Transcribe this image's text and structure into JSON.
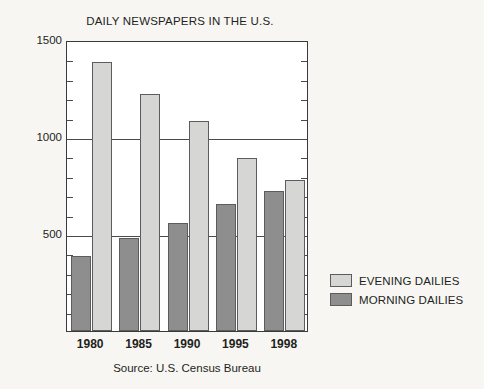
{
  "chart_data": {
    "type": "bar",
    "title": "DAILY NEWSPAPERS IN THE U.S.",
    "xlabel": "",
    "ylabel": "",
    "categories": [
      "1980",
      "1985",
      "1990",
      "1995",
      "1998"
    ],
    "series": [
      {
        "name": "EVENING DAILIES",
        "color": "#d6d6d4",
        "values": [
          1388,
          1220,
          1084,
          891,
          781
        ]
      },
      {
        "name": "MORNING DAILIES",
        "color": "#8e8e8e",
        "values": [
          387,
          482,
          559,
          656,
          721
        ]
      }
    ],
    "ylim": [
      0,
      1500
    ],
    "ytick_labels": [
      "1500",
      "1000",
      "500"
    ],
    "ytick_values": [
      1500,
      1000,
      500
    ],
    "minor_tick_step": 100,
    "gridlines": [
      1500,
      1000,
      500
    ],
    "grid": true,
    "legend_position": "right",
    "source": "Source: U.S. Census Bureau"
  },
  "legend": {
    "items": [
      {
        "label": "EVENING DAILIES",
        "swatch": "evening"
      },
      {
        "label": "MORNING DAILIES",
        "swatch": "morning"
      }
    ]
  },
  "colors": {
    "background": "#f7f6f3",
    "plot_background": "#ffffff",
    "axis": "#3a3a3a",
    "evening": "#d6d6d4",
    "morning": "#8e8e8e",
    "text": "#231f20"
  }
}
